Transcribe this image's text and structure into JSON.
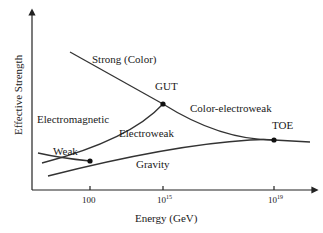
{
  "diagram": {
    "y_axis_label": "Effective Strength",
    "x_axis_label": "Energy (GeV)",
    "x_ticks": [
      {
        "base": "100",
        "exp": ""
      },
      {
        "base": "10",
        "exp": "15"
      },
      {
        "base": "10",
        "exp": "19"
      }
    ],
    "curves": {
      "strong": "Strong (Color)",
      "electromagnetic": "Electromagnetic",
      "weak": "Weak",
      "electroweak": "Electroweak",
      "color_electroweak": "Color-electroweak",
      "gravity": "Gravity"
    },
    "points": {
      "gut": "GUT",
      "toe": "TOE"
    },
    "colors": {
      "line": "#333333",
      "background": "#ffffff"
    }
  }
}
